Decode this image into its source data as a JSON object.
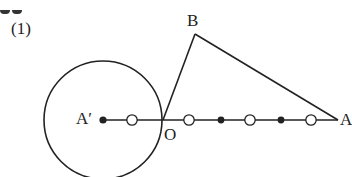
{
  "problem": {
    "number_label": "(1)"
  },
  "geometry": {
    "stroke_color": "#222222",
    "points": {
      "B": {
        "label": "B",
        "x": 195,
        "y": 34
      },
      "O": {
        "label": "O",
        "x": 163,
        "y": 120
      },
      "A": {
        "label": "A",
        "x": 338,
        "y": 120
      },
      "A_prime": {
        "label": "A′",
        "x": 103,
        "y": 120
      }
    },
    "circle": {
      "center": "A_prime",
      "cx": 103,
      "cy": 120,
      "r": 59
    },
    "segments": [
      [
        "A_prime",
        "A"
      ],
      [
        "O",
        "B"
      ],
      [
        "B",
        "A"
      ]
    ],
    "tick_marks": [
      {
        "type": "open-circle",
        "x": 132
      },
      {
        "type": "open-circle",
        "x": 189
      },
      {
        "type": "filled-dot",
        "x": 221
      },
      {
        "type": "open-circle",
        "x": 250
      },
      {
        "type": "filled-dot",
        "x": 281
      },
      {
        "type": "open-circle",
        "x": 311
      }
    ]
  }
}
